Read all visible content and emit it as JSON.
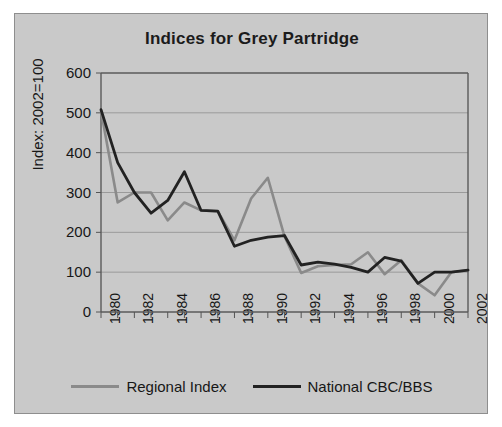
{
  "figure": {
    "background_color": "#c9c9c9",
    "border_color": "#8e8e8e"
  },
  "chart_data": {
    "type": "line",
    "title": "Indices for Grey Partridge",
    "xlabel": "",
    "ylabel": "Index: 2002=100",
    "ylim": [
      0,
      600
    ],
    "ytick_step": 100,
    "yticks": [
      "600",
      "500",
      "400",
      "300",
      "200",
      "100",
      "0"
    ],
    "grid": true,
    "grid_axis": "y",
    "legend_position": "bottom",
    "x": [
      1980,
      1981,
      1982,
      1983,
      1984,
      1985,
      1986,
      1987,
      1988,
      1989,
      1990,
      1991,
      1992,
      1993,
      1994,
      1995,
      1996,
      1997,
      1998,
      1999,
      2000,
      2001,
      2002
    ],
    "xtick_labels": [
      "1980",
      "1982",
      "1984",
      "1986",
      "1988",
      "1990",
      "1992",
      "1994",
      "1996",
      "1998",
      "2000",
      "2002"
    ],
    "xtick_values": [
      1980,
      1982,
      1984,
      1986,
      1988,
      1990,
      1992,
      1994,
      1996,
      1998,
      2000,
      2002
    ],
    "series": [
      {
        "name": "Regional Index",
        "color": "#8a8a8a",
        "width": 2.6,
        "values": [
          505,
          275,
          300,
          300,
          230,
          275,
          255,
          253,
          180,
          285,
          337,
          190,
          98,
          115,
          118,
          120,
          150,
          95,
          130,
          72,
          42,
          100,
          105
        ]
      },
      {
        "name": "National CBC/BBS",
        "color": "#222222",
        "width": 2.8,
        "values": [
          508,
          375,
          300,
          248,
          280,
          352,
          255,
          253,
          165,
          180,
          188,
          192,
          118,
          125,
          120,
          112,
          100,
          137,
          128,
          72,
          100,
          100,
          105
        ]
      }
    ]
  }
}
